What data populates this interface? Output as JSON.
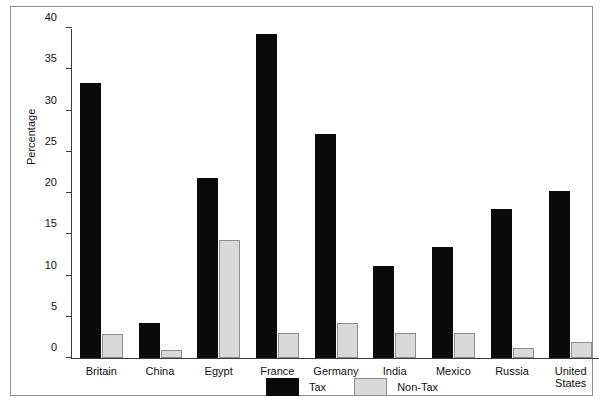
{
  "chart_data": {
    "type": "bar",
    "title": "",
    "xlabel": "",
    "ylabel": "Percentage",
    "ylim": [
      0,
      40
    ],
    "yticks": [
      0,
      5,
      10,
      15,
      20,
      25,
      30,
      35,
      40
    ],
    "ytick_labels": [
      "0",
      "5",
      "10",
      "15",
      "20",
      "25",
      "30",
      "35",
      "40"
    ],
    "grid": false,
    "legend_position": "bottom-center",
    "categories": [
      "Britain",
      "China",
      "Egypt",
      "France",
      "Germany",
      "India",
      "Mexico",
      "Russia",
      "United States"
    ],
    "category_lines": [
      [
        "Britain"
      ],
      [
        "China"
      ],
      [
        "Egypt"
      ],
      [
        "France"
      ],
      [
        "Germany"
      ],
      [
        "India"
      ],
      [
        "Mexico"
      ],
      [
        "Russia"
      ],
      [
        "United",
        "States"
      ]
    ],
    "series": [
      {
        "name": "Tax",
        "color": "#0a0a0a",
        "values": [
          33.3,
          4.2,
          21.8,
          39.3,
          27.2,
          11.2,
          13.5,
          18.1,
          20.3
        ]
      },
      {
        "name": "Non-Tax",
        "color": "#d9d9d9",
        "values": [
          2.9,
          1.0,
          14.3,
          3.0,
          4.3,
          3.0,
          3.0,
          1.2,
          1.9
        ]
      }
    ]
  },
  "axis": {
    "y_title": "Percentage"
  },
  "legend": {
    "items": [
      {
        "label": "Tax",
        "swatch": "black-square-swatch"
      },
      {
        "label": "Non-Tax",
        "swatch": "gray-square-swatch"
      }
    ]
  }
}
